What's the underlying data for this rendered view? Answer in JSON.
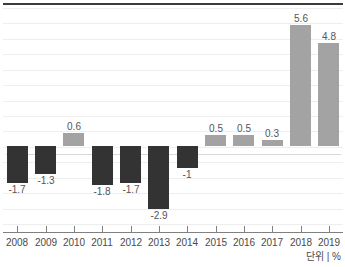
{
  "chart_data": {
    "type": "bar",
    "title": "",
    "subtitle": "",
    "xlabel": "",
    "ylabel": "",
    "unit_caption": "단위 | %",
    "categories": [
      "2008",
      "2009",
      "2010",
      "2011",
      "2012",
      "2013",
      "2014",
      "2015",
      "2016",
      "2017",
      "2018",
      "2019"
    ],
    "values": [
      -1.7,
      -1.3,
      0.6,
      -1.8,
      -1.7,
      -2.9,
      -1,
      0.5,
      0.5,
      0.3,
      5.6,
      4.8
    ],
    "value_labels": [
      "-1.7",
      "-1.3",
      "0.6",
      "-1.8",
      "-1.7",
      "-2.9",
      "-1",
      "0.5",
      "0.5",
      "0.3",
      "5.6",
      "4.8"
    ],
    "colors": {
      "negative_bar": "#333333",
      "positive_bar": "#a3a3a3",
      "gridline": "#eeeeee",
      "zero_line": "#d8d8d8",
      "axis_line": "#808080",
      "top_rule": "#3c3c3c",
      "label_text": "#555555",
      "tick_text": "#4a4a4a",
      "background": "#ffffff"
    },
    "ylim": [
      -3.6,
      6.4
    ],
    "grid": true,
    "gridline_count": 15,
    "legend": [],
    "legend_position": "none"
  }
}
